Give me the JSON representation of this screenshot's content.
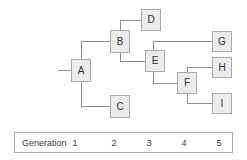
{
  "diagram": {
    "type": "pedigree-generation-chart",
    "nodes": [
      {
        "id": "A",
        "label": "A",
        "generation": 1,
        "x": 71,
        "y": 59,
        "w": 20,
        "h": 23
      },
      {
        "id": "B",
        "label": "B",
        "generation": 2,
        "x": 110,
        "y": 30,
        "w": 20,
        "h": 23
      },
      {
        "id": "C",
        "label": "C",
        "generation": 2,
        "x": 110,
        "y": 95,
        "w": 20,
        "h": 23
      },
      {
        "id": "D",
        "label": "D",
        "generation": 3,
        "x": 141,
        "y": 9,
        "w": 20,
        "h": 22
      },
      {
        "id": "E",
        "label": "E",
        "generation": 3,
        "x": 145,
        "y": 50,
        "w": 20,
        "h": 22
      },
      {
        "id": "F",
        "label": "F",
        "generation": 4,
        "x": 177,
        "y": 72,
        "w": 20,
        "h": 22
      },
      {
        "id": "G",
        "label": "G",
        "generation": 5,
        "x": 212,
        "y": 31,
        "w": 20,
        "h": 21
      },
      {
        "id": "H",
        "label": "H",
        "generation": 5,
        "x": 212,
        "y": 57,
        "w": 20,
        "h": 21
      },
      {
        "id": "I",
        "label": "I",
        "generation": 5,
        "x": 212,
        "y": 93,
        "w": 20,
        "h": 21
      }
    ],
    "edges": [
      {
        "from": "root-stub",
        "to": "A"
      },
      {
        "from": "A",
        "to": "B"
      },
      {
        "from": "A",
        "to": "C"
      },
      {
        "from": "B",
        "to": "D"
      },
      {
        "from": "B",
        "to": "E"
      },
      {
        "from": "E",
        "to": "G"
      },
      {
        "from": "E",
        "to": "F"
      },
      {
        "from": "F",
        "to": "H"
      },
      {
        "from": "F",
        "to": "I"
      }
    ],
    "line_color": "#8d8d90",
    "box_fill": "#ececed",
    "box_border": "#a9a9ab"
  },
  "generation_bar": {
    "label": "Generation",
    "numbers": [
      "1",
      "2",
      "3",
      "4",
      "5"
    ],
    "number_x": [
      74,
      113,
      148,
      183,
      218
    ]
  }
}
